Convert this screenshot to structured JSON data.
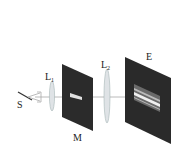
{
  "diagram": {
    "title": "",
    "labels": {
      "source": "S",
      "lens1": "L",
      "lens1_sub": "1",
      "mask": "M",
      "lens2": "L",
      "lens2_sub": "2",
      "screen": "E"
    },
    "colors": {
      "panel": "#2a2a2a",
      "lens": "#d8dde0",
      "beam": "#9a9a9a",
      "fringe_light": "#e8e8e8",
      "fringe_dark": "#555555"
    }
  }
}
